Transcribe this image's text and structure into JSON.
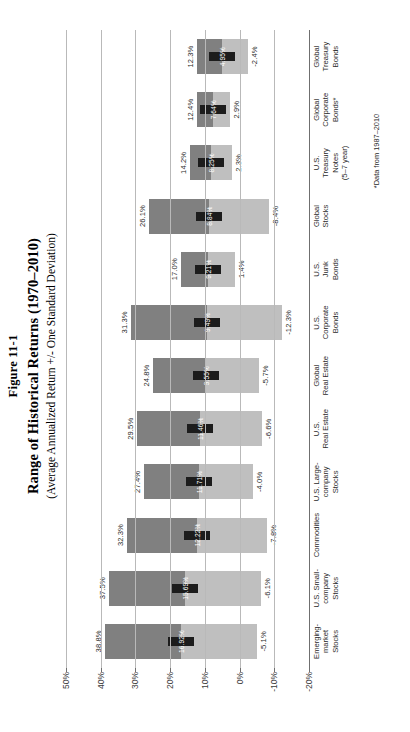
{
  "figure": {
    "label": "Figure 11-1",
    "title": "Range of Historical Returns (1970–2010)",
    "subtitle": "(Average Annualized Return +/- One Standard Deviation)",
    "footnote": "*Data from 1987–2010"
  },
  "colors": {
    "upper_band": "#808080",
    "lower_band": "#bfbfbf",
    "mean_marker": "#1c1c1c",
    "gridline": "#b9b9b9",
    "axis": "#6f6f6f",
    "text": "#2b2b2b",
    "mean_label": "#ffffff"
  },
  "chart_data": {
    "type": "bar",
    "title": "Range of Historical Returns (1970–2010)",
    "subtitle": "(Average Annualized Return +/- One Standard Deviation)",
    "orientation": "vertical-floating-bar",
    "xlabel": "",
    "ylabel": "",
    "ylim": [
      -20,
      50
    ],
    "grid": true,
    "legend": false,
    "ytick_labels": [
      "50%",
      "40%",
      "30%",
      "20%",
      "10%",
      "0%",
      "-10%",
      "-20%"
    ],
    "ytick_values": [
      50,
      40,
      30,
      20,
      10,
      0,
      -10,
      -20
    ],
    "categories": [
      "Emerging-market Stocks",
      "U.S. Small-company Stocks",
      "Commodities",
      "U.S. Large-company Stocks",
      "U.S. Real Estate",
      "Global Real Estate",
      "U.S. Corporate Bonds",
      "U.S. Junk Bonds",
      "Global Stocks",
      "U.S. Treasury Notes (5–7 year)",
      "Global Corporate Bonds*",
      "Global Treasury Bonds"
    ],
    "category_lines": [
      [
        "Emerging-",
        "market",
        "Stocks"
      ],
      [
        "U.S. Small-",
        "company",
        "Stocks"
      ],
      [
        "Commodities"
      ],
      [
        "U.S. Large-",
        "company",
        "Stocks"
      ],
      [
        "U.S.",
        "Real Estate"
      ],
      [
        "Global",
        "Real Estate"
      ],
      [
        "U.S.",
        "Corporate",
        "Bonds"
      ],
      [
        "U.S.",
        "Junk",
        "Bonds"
      ],
      [
        "Global",
        "Stocks"
      ],
      [
        "U.S.",
        "Treasury",
        "Notes",
        "(5–7 year)"
      ],
      [
        "Global",
        "Corporate",
        "Bonds*"
      ],
      [
        "Global",
        "Treasury",
        "Bonds"
      ]
    ],
    "series": [
      {
        "name": "High (mean + 1 SD)",
        "values": [
          38.8,
          37.5,
          32.3,
          27.4,
          29.5,
          24.8,
          31.3,
          17.0,
          26.1,
          14.2,
          12.4,
          12.3
        ],
        "labels": [
          "38.8%",
          "37.5%",
          "32.3%",
          "27.4%",
          "29.5%",
          "24.8%",
          "31.3%",
          "17.0%",
          "26.1%",
          "14.2%",
          "12.4%",
          "12.3%"
        ]
      },
      {
        "name": "Average annualized return",
        "values": [
          16.92,
          15.69,
          12.22,
          11.71,
          11.46,
          9.55,
          9.49,
          9.21,
          8.84,
          8.25,
          7.64,
          4.95
        ],
        "labels": [
          "16.92%",
          "15.69%",
          "12.22%",
          "11.71%",
          "11.46%",
          "9.55%",
          "9.49%",
          "9.21%",
          "8.84%",
          "8.25%",
          "7.64%",
          "4.95%"
        ]
      },
      {
        "name": "Low (mean - 1 SD)",
        "values": [
          -5.1,
          -6.1,
          -7.8,
          -4.0,
          -6.6,
          -5.7,
          -12.3,
          1.4,
          -8.4,
          2.3,
          2.9,
          -2.4
        ],
        "labels": [
          "-5.1%",
          "-6.1%",
          "-7.8%",
          "-4.0%",
          "-6.6%",
          "-5.7%",
          "-12.3%",
          "1.4%",
          "-8.4%",
          "2.3%",
          "2.9%",
          "-2.4%"
        ]
      }
    ]
  }
}
